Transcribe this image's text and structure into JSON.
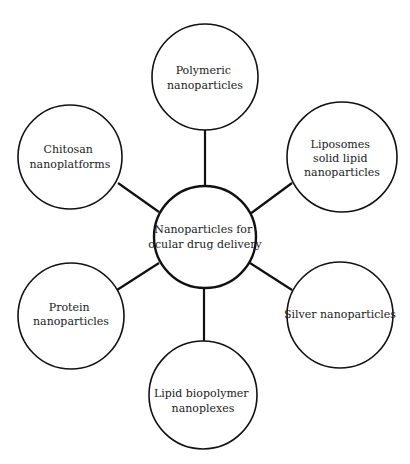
{
  "diagram": {
    "type": "hub-and-spoke",
    "stroke_color": "#111111",
    "background": "#ffffff",
    "center": {
      "lines": [
        "Nanoparticles for",
        "ocular drug delivery"
      ]
    },
    "nodes": [
      {
        "id": "polymeric",
        "lines": [
          "Polymeric",
          "nanoparticles"
        ]
      },
      {
        "id": "liposomes",
        "lines": [
          "Liposomes",
          "solid lipid",
          "nanoparticles"
        ]
      },
      {
        "id": "silver",
        "lines": [
          "Silver nanoparticles"
        ]
      },
      {
        "id": "lipid-biopolymer",
        "lines": [
          "Lipid biopolymer",
          "nanoplexes"
        ]
      },
      {
        "id": "protein",
        "lines": [
          "Protein",
          "nanoparticles"
        ]
      },
      {
        "id": "chitosan",
        "lines": [
          "Chitosan",
          "nanoplatforms"
        ]
      }
    ]
  }
}
